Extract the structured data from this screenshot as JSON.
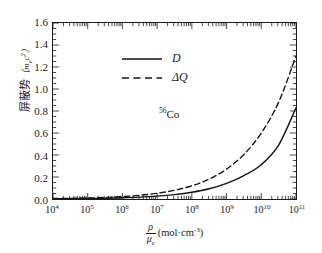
{
  "chart_data": {
    "type": "line",
    "title": "",
    "subtitle": "",
    "xlabel_parts": {
      "numerator": "ρ",
      "denominator": "μ",
      "denominator_sub": "e",
      "units": "(mol·cm",
      "units_sup": "-3",
      "units_close": ")"
    },
    "ylabel_text": "屏蔽势",
    "ylabel_unit_open": "（",
    "ylabel_unit_m": "m",
    "ylabel_unit_sub": "e",
    "ylabel_unit_c": "c",
    "ylabel_unit_sup": "2",
    "ylabel_unit_close": "）",
    "annotation": "Co",
    "annotation_sup": "56",
    "xscale": "log",
    "xlim": [
      10000.0,
      100000000000.0
    ],
    "ylim": [
      0.0,
      1.6
    ],
    "grid": false,
    "legend_position": "upper-left-inside",
    "xticks": [
      {
        "value": 10000.0,
        "mantissa": "10",
        "exponent": "4"
      },
      {
        "value": 100000.0,
        "mantissa": "10",
        "exponent": "5"
      },
      {
        "value": 1000000.0,
        "mantissa": "10",
        "exponent": "6"
      },
      {
        "value": 10000000.0,
        "mantissa": "10",
        "exponent": "7"
      },
      {
        "value": 100000000.0,
        "mantissa": "10",
        "exponent": "8"
      },
      {
        "value": 1000000000.0,
        "mantissa": "10",
        "exponent": "9"
      },
      {
        "value": 10000000000.0,
        "mantissa": "10",
        "exponent": "10"
      },
      {
        "value": 100000000000.0,
        "mantissa": "10",
        "exponent": "11"
      }
    ],
    "yticks": [
      {
        "value": 0.0,
        "label": "0.0"
      },
      {
        "value": 0.2,
        "label": "0.2"
      },
      {
        "value": 0.4,
        "label": "0.4"
      },
      {
        "value": 0.6,
        "label": "0.6"
      },
      {
        "value": 0.8,
        "label": "0.8"
      },
      {
        "value": 1.0,
        "label": "1.0"
      },
      {
        "value": 1.2,
        "label": "1.2"
      },
      {
        "value": 1.4,
        "label": "1.4"
      },
      {
        "value": 1.6,
        "label": "1.6"
      }
    ],
    "series": [
      {
        "name": "D",
        "legend_label": "D",
        "style": "solid",
        "color": "#141414",
        "x": [
          10000.0,
          31620.0,
          100000.0,
          316200.0,
          1000000.0,
          3162000.0,
          10000000.0,
          31620000.0,
          100000000.0,
          316200000.0,
          1000000000.0,
          3162000000.0,
          10000000000.0,
          31620000000.0,
          100000000000.0
        ],
        "y": [
          0.002,
          0.003,
          0.005,
          0.007,
          0.011,
          0.017,
          0.026,
          0.04,
          0.061,
          0.093,
          0.142,
          0.213,
          0.312,
          0.49,
          0.83
        ]
      },
      {
        "name": "DeltaQ",
        "legend_label": "ΔQ",
        "style": "dashed",
        "color": "#141414",
        "x": [
          10000.0,
          31620.0,
          100000.0,
          316200.0,
          1000000.0,
          3162000.0,
          10000000.0,
          31620000.0,
          100000000.0,
          316200000.0,
          1000000000.0,
          3162000000.0,
          10000000000.0,
          31620000000.0,
          100000000000.0
        ],
        "y": [
          0.004,
          0.006,
          0.009,
          0.014,
          0.022,
          0.034,
          0.052,
          0.079,
          0.12,
          0.181,
          0.272,
          0.405,
          0.6,
          0.88,
          1.3
        ]
      }
    ]
  }
}
